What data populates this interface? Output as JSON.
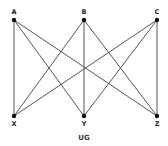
{
  "diagram": {
    "caption": "UG",
    "nodes": [
      {
        "id": "A",
        "label": "A",
        "x": 14,
        "y": 20,
        "label_x": 14,
        "label_y": 14
      },
      {
        "id": "B",
        "label": "B",
        "x": 84,
        "y": 20,
        "label_x": 84,
        "label_y": 14
      },
      {
        "id": "C",
        "label": "C",
        "x": 157,
        "y": 20,
        "label_x": 157,
        "label_y": 14
      },
      {
        "id": "X",
        "label": "X",
        "x": 14,
        "y": 116,
        "label_x": 14,
        "label_y": 126
      },
      {
        "id": "Y",
        "label": "Y",
        "x": 84,
        "y": 116,
        "label_x": 84,
        "label_y": 126
      },
      {
        "id": "Z",
        "label": "Z",
        "x": 157,
        "y": 116,
        "label_x": 157,
        "label_y": 126
      }
    ],
    "edges": [
      [
        "A",
        "X"
      ],
      [
        "A",
        "Y"
      ],
      [
        "A",
        "Z"
      ],
      [
        "B",
        "X"
      ],
      [
        "B",
        "Y"
      ],
      [
        "B",
        "Z"
      ],
      [
        "C",
        "X"
      ],
      [
        "C",
        "Y"
      ],
      [
        "C",
        "Z"
      ]
    ],
    "caption_pos": {
      "x": 84,
      "y": 140
    }
  }
}
